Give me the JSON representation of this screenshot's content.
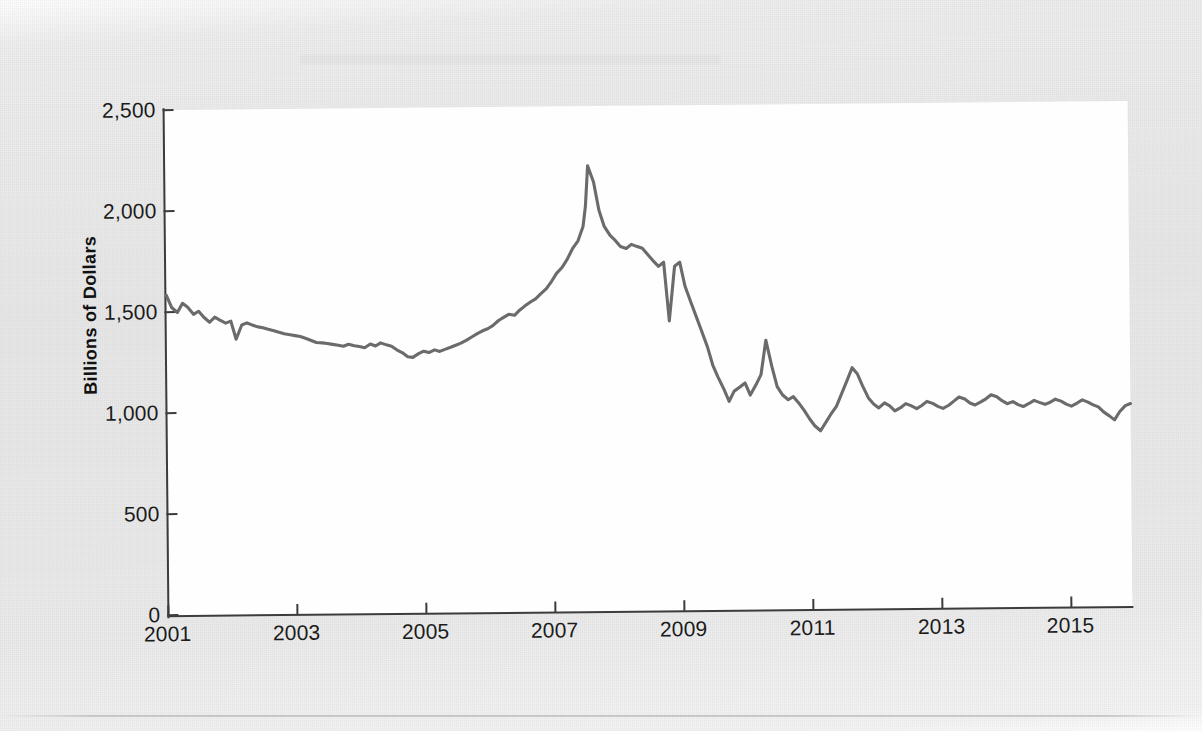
{
  "figure": {
    "background_color": "#e9e9e9",
    "plot_background_color": "#fefefe",
    "axis_color": "#3c3c3c",
    "line_color": "#6b6b6b"
  },
  "axis_title_y": "Billions of Dollars",
  "y_ticks": [
    "2,500",
    "2,000",
    "1,500",
    "1,000",
    "500",
    "0"
  ],
  "x_ticks": [
    "2001",
    "2003",
    "2005",
    "2007",
    "2009",
    "2011",
    "2013",
    "2015"
  ],
  "chart_data": {
    "type": "line",
    "title": "",
    "xlabel": "",
    "ylabel": "Billions of Dollars",
    "xlim": [
      2001.0,
      2016.0
    ],
    "ylim": [
      0,
      2500
    ],
    "ytick_values": [
      0,
      500,
      1000,
      1500,
      2000,
      2500
    ],
    "xtick_values": [
      2001,
      2003,
      2005,
      2007,
      2009,
      2011,
      2013,
      2015
    ],
    "grid": false,
    "legend": null,
    "units": "Billions of Dollars",
    "series": [
      {
        "name": "Outstanding amount",
        "color": "#6b6b6b",
        "x": [
          2001.0,
          2001.08,
          2001.17,
          2001.25,
          2001.33,
          2001.42,
          2001.5,
          2001.58,
          2001.67,
          2001.75,
          2001.83,
          2001.92,
          2002.0,
          2002.08,
          2002.17,
          2002.25,
          2002.33,
          2002.42,
          2002.5,
          2002.58,
          2002.67,
          2002.75,
          2002.83,
          2002.92,
          2003.0,
          2003.08,
          2003.17,
          2003.25,
          2003.33,
          2003.42,
          2003.5,
          2003.58,
          2003.67,
          2003.75,
          2003.83,
          2003.92,
          2004.0,
          2004.08,
          2004.17,
          2004.25,
          2004.33,
          2004.42,
          2004.5,
          2004.58,
          2004.67,
          2004.75,
          2004.83,
          2004.92,
          2005.0,
          2005.08,
          2005.17,
          2005.25,
          2005.33,
          2005.42,
          2005.5,
          2005.58,
          2005.67,
          2005.75,
          2005.83,
          2005.92,
          2006.0,
          2006.08,
          2006.17,
          2006.25,
          2006.33,
          2006.42,
          2006.5,
          2006.58,
          2006.67,
          2006.75,
          2006.83,
          2006.92,
          2007.0,
          2007.08,
          2007.17,
          2007.25,
          2007.33,
          2007.42,
          2007.5,
          2007.54,
          2007.58,
          2007.67,
          2007.75,
          2007.83,
          2007.92,
          2008.0,
          2008.08,
          2008.17,
          2008.25,
          2008.33,
          2008.42,
          2008.5,
          2008.58,
          2008.67,
          2008.75,
          2008.83,
          2008.92,
          2009.0,
          2009.08,
          2009.17,
          2009.25,
          2009.33,
          2009.42,
          2009.5,
          2009.58,
          2009.67,
          2009.75,
          2009.83,
          2009.92,
          2010.0,
          2010.08,
          2010.17,
          2010.25,
          2010.33,
          2010.42,
          2010.5,
          2010.58,
          2010.67,
          2010.75,
          2010.83,
          2010.92,
          2011.0,
          2011.08,
          2011.17,
          2011.25,
          2011.33,
          2011.42,
          2011.5,
          2011.58,
          2011.67,
          2011.75,
          2011.83,
          2011.92,
          2012.0,
          2012.08,
          2012.17,
          2012.25,
          2012.33,
          2012.42,
          2012.5,
          2012.58,
          2012.67,
          2012.75,
          2012.83,
          2012.92,
          2013.0,
          2013.08,
          2013.17,
          2013.25,
          2013.33,
          2013.42,
          2013.5,
          2013.58,
          2013.67,
          2013.75,
          2013.83,
          2013.92,
          2014.0,
          2014.08,
          2014.17,
          2014.25,
          2014.33,
          2014.42,
          2014.5,
          2014.58,
          2014.67,
          2014.75,
          2014.83,
          2014.92,
          2015.0,
          2015.08,
          2015.17,
          2015.25,
          2015.33,
          2015.42,
          2015.5,
          2015.58,
          2015.67,
          2015.75,
          2015.83,
          2015.92,
          2016.0
        ],
        "y": [
          1580,
          1520,
          1495,
          1540,
          1520,
          1485,
          1500,
          1470,
          1445,
          1470,
          1455,
          1440,
          1450,
          1360,
          1430,
          1440,
          1430,
          1420,
          1415,
          1408,
          1400,
          1392,
          1385,
          1380,
          1375,
          1370,
          1360,
          1350,
          1340,
          1338,
          1335,
          1330,
          1325,
          1320,
          1330,
          1322,
          1318,
          1312,
          1330,
          1320,
          1335,
          1325,
          1318,
          1300,
          1285,
          1265,
          1262,
          1280,
          1292,
          1285,
          1298,
          1290,
          1300,
          1310,
          1320,
          1330,
          1345,
          1360,
          1375,
          1390,
          1400,
          1415,
          1440,
          1455,
          1470,
          1465,
          1490,
          1510,
          1530,
          1545,
          1570,
          1595,
          1630,
          1670,
          1700,
          1740,
          1790,
          1830,
          1900,
          2000,
          2200,
          2120,
          1980,
          1900,
          1855,
          1830,
          1800,
          1790,
          1810,
          1800,
          1790,
          1760,
          1730,
          1700,
          1720,
          1430,
          1700,
          1720,
          1600,
          1520,
          1450,
          1380,
          1300,
          1210,
          1150,
          1090,
          1030,
          1080,
          1100,
          1120,
          1060,
          1110,
          1160,
          1330,
          1200,
          1100,
          1060,
          1035,
          1050,
          1020,
          980,
          940,
          905,
          880,
          920,
          960,
          1000,
          1060,
          1120,
          1190,
          1160,
          1100,
          1040,
          1010,
          990,
          1015,
          1000,
          975,
          990,
          1010,
          1000,
          985,
          1000,
          1020,
          1010,
          995,
          985,
          1000,
          1020,
          1040,
          1030,
          1010,
          1000,
          1015,
          1030,
          1050,
          1040,
          1020,
          1005,
          1015,
          1000,
          990,
          1005,
          1020,
          1010,
          1000,
          1010,
          1025,
          1015,
          1000,
          990,
          1005,
          1020,
          1010,
          995,
          985,
          960,
          940,
          920,
          960,
          990,
          1000
        ]
      }
    ]
  }
}
